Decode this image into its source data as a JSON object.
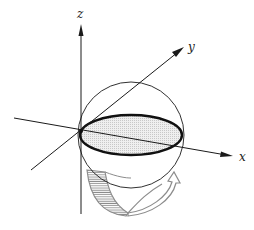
{
  "diagram": {
    "axes": {
      "x": {
        "label": "x"
      },
      "y": {
        "label": "y"
      },
      "z": {
        "label": "z"
      }
    },
    "elements": [
      {
        "name": "sphere",
        "kind": "circle outline"
      },
      {
        "name": "equatorial-disk",
        "kind": "shaded ellipse with bold outline"
      },
      {
        "name": "rotation-arrow",
        "kind": "curved grey hatched ribbon arrow around z-axis"
      }
    ],
    "colors": {
      "line": "#1a1a1a",
      "disk_fill": "#e6e6e6",
      "arrow": "#8c8c8c",
      "background": "#ffffff"
    }
  }
}
